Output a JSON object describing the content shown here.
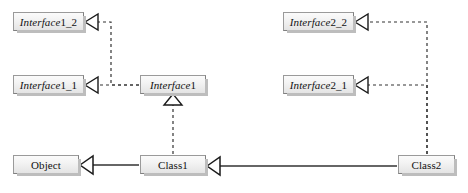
{
  "diagram": {
    "kind": "uml-class-diagram",
    "title": "",
    "colors": {
      "box_fill_top": "#fbfbfb",
      "box_fill_bottom": "#e4e4e4",
      "box_border": "#808080",
      "box_shadow": "#bdbdbd",
      "line": "#333333",
      "background": "#ffffff"
    },
    "nodes": [
      {
        "id": "interface1_2",
        "label": "Interface1_2",
        "italic_part": "Interface",
        "plain_part": "1_2",
        "stereotype": "interface",
        "x": 13,
        "y": 12,
        "w": 71,
        "h": 19
      },
      {
        "id": "interface2_2",
        "label": "Interface2_2",
        "italic_part": "Interface",
        "plain_part": "2_2",
        "stereotype": "interface",
        "x": 283,
        "y": 12,
        "w": 71,
        "h": 19
      },
      {
        "id": "interface1_1",
        "label": "Interface1_1",
        "italic_part": "Interface",
        "plain_part": "1_1",
        "stereotype": "interface",
        "x": 13,
        "y": 75,
        "w": 71,
        "h": 19
      },
      {
        "id": "interface1",
        "label": "Interface1",
        "italic_part": "Interface",
        "plain_part": "1",
        "stereotype": "interface",
        "x": 140,
        "y": 75,
        "w": 66,
        "h": 19
      },
      {
        "id": "interface2_1",
        "label": "Interface2_1",
        "italic_part": "Interface",
        "plain_part": "2_1",
        "stereotype": "interface",
        "x": 283,
        "y": 75,
        "w": 71,
        "h": 19
      },
      {
        "id": "object",
        "label": "Object",
        "italic_part": "",
        "plain_part": "Object",
        "stereotype": "class",
        "x": 13,
        "y": 155,
        "w": 66,
        "h": 19
      },
      {
        "id": "class1",
        "label": "Class1",
        "italic_part": "",
        "plain_part": "Class1",
        "stereotype": "class",
        "x": 140,
        "y": 155,
        "w": 66,
        "h": 19
      },
      {
        "id": "class2",
        "label": "Class2",
        "italic_part": "",
        "plain_part": "Class2",
        "stereotype": "class",
        "x": 398,
        "y": 155,
        "w": 57,
        "h": 19
      }
    ],
    "edges": [
      {
        "id": "e1",
        "from": "interface1",
        "to": "interface1_1",
        "type": "generalization-dashed",
        "style": "dashed",
        "arrow": "hollow-triangle"
      },
      {
        "id": "e2",
        "from": "interface1",
        "to": "interface1_2",
        "type": "generalization-dashed",
        "style": "dashed",
        "arrow": "hollow-triangle"
      },
      {
        "id": "e3",
        "from": "class1",
        "to": "interface1",
        "type": "realization",
        "style": "dashed",
        "arrow": "hollow-triangle"
      },
      {
        "id": "e4",
        "from": "class1",
        "to": "object",
        "type": "generalization",
        "style": "solid",
        "arrow": "hollow-triangle"
      },
      {
        "id": "e5",
        "from": "class2",
        "to": "class1",
        "type": "generalization",
        "style": "solid",
        "arrow": "hollow-triangle"
      },
      {
        "id": "e6",
        "from": "class2",
        "to": "interface2_1",
        "type": "realization",
        "style": "dashed",
        "arrow": "hollow-triangle"
      },
      {
        "id": "e7",
        "from": "class2",
        "to": "interface2_2",
        "type": "realization",
        "style": "dashed",
        "arrow": "hollow-triangle"
      }
    ]
  }
}
